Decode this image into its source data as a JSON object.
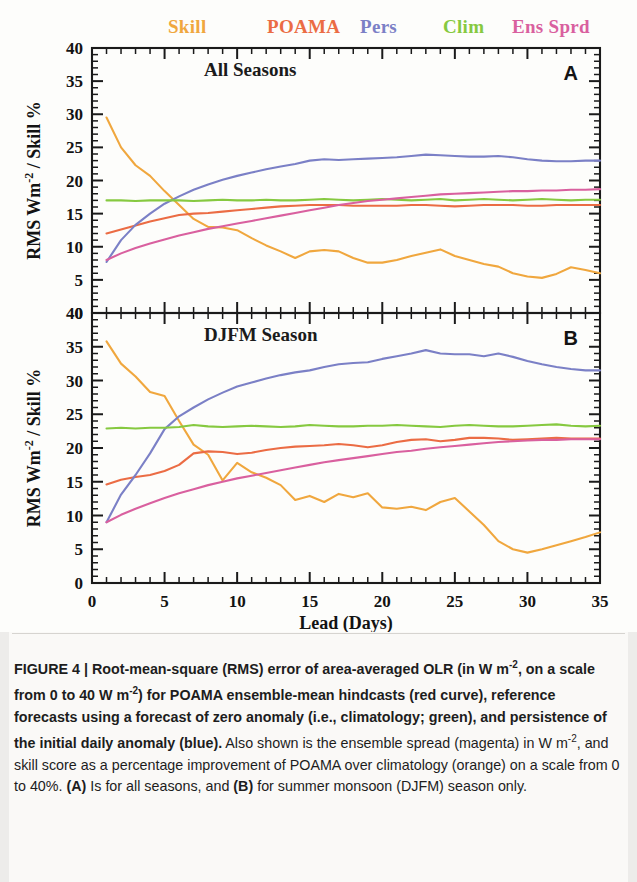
{
  "legend": [
    {
      "label": "Skill",
      "color": "#f0a73e",
      "x": 168
    },
    {
      "label": "POAMA",
      "color": "#eb6c44",
      "x": 267
    },
    {
      "label": "Pers",
      "color": "#7b80c6",
      "x": 360
    },
    {
      "label": "Clim",
      "color": "#86c940",
      "x": 443
    },
    {
      "label": "Ens Sprd",
      "color": "#d9609f",
      "x": 512
    }
  ],
  "axis": {
    "xlabel": "Lead (Days)",
    "ylabel_main": "RMS Wm",
    "ylabel_exp": "-2",
    "ylabel_tail": "/ Skill %",
    "xticks": [
      0,
      5,
      10,
      15,
      20,
      25,
      30,
      35
    ],
    "yticks": [
      0,
      5,
      10,
      15,
      20,
      25,
      30,
      35,
      40
    ],
    "xlim": [
      0,
      35
    ],
    "ylim": [
      0,
      40
    ]
  },
  "caption": {
    "figure_label": "FIGURE 4 |",
    "bold_lead": "Root-mean-square (RMS) error of area-averaged OLR (in W m",
    "bold_exp1": "-2",
    "bold_mid": ", on a scale from 0 to 40 W m",
    "bold_exp2": "-2",
    "bold_mid2": ") for POAMA ensemble-mean hindcasts (red curve), reference forecasts using a forecast of zero anomaly (i.e., climatology; green), and persistence of the initial daily anomaly (blue).",
    "normal_1": " Also shown is the ensemble spread (magenta) in W m",
    "exp3": "-2",
    "normal_2": ", and skill score as a percentage improvement of POAMA over climatology (orange) on a scale from 0 to 40%. ",
    "bold_A": "(A)",
    "normal_3": " Is for all seasons, and ",
    "bold_B": "(B)",
    "normal_4": " for summer monsoon (DJFM) season only."
  },
  "chart_data": [
    {
      "type": "line",
      "panel": "A",
      "title": "All Seasons",
      "letter": "A",
      "xlabel": "Lead (Days)",
      "ylabel": "RMS Wm-2 / Skill %",
      "xlim": [
        0,
        35
      ],
      "ylim": [
        0,
        40
      ],
      "grid": false,
      "x": [
        1,
        2,
        3,
        4,
        5,
        6,
        7,
        8,
        9,
        10,
        11,
        12,
        13,
        14,
        15,
        16,
        17,
        18,
        19,
        20,
        21,
        22,
        23,
        24,
        25,
        26,
        27,
        28,
        29,
        30,
        31,
        32,
        33,
        34,
        35
      ],
      "series": [
        {
          "name": "Skill",
          "color": "#f0a73e",
          "values": [
            29.5,
            25.0,
            22.3,
            20.7,
            18.4,
            16.3,
            14.2,
            13.0,
            12.9,
            12.5,
            11.3,
            10.2,
            9.3,
            8.3,
            9.3,
            9.5,
            9.3,
            8.3,
            7.6,
            7.6,
            8.0,
            8.6,
            9.1,
            9.6,
            8.6,
            8.0,
            7.4,
            7.0,
            6.0,
            5.5,
            5.3,
            5.9,
            6.9,
            6.5,
            6.0
          ]
        },
        {
          "name": "POAMA",
          "color": "#eb6c44",
          "values": [
            12.0,
            12.6,
            13.2,
            13.8,
            14.3,
            14.8,
            15.0,
            15.1,
            15.3,
            15.5,
            15.7,
            15.9,
            16.1,
            16.2,
            16.3,
            16.3,
            16.3,
            16.2,
            16.2,
            16.2,
            16.2,
            16.3,
            16.3,
            16.2,
            16.1,
            16.2,
            16.3,
            16.3,
            16.3,
            16.2,
            16.2,
            16.3,
            16.3,
            16.3,
            16.3
          ]
        },
        {
          "name": "Pers",
          "color": "#7b80c6",
          "values": [
            7.7,
            11.0,
            13.3,
            15.0,
            16.5,
            17.6,
            18.6,
            19.4,
            20.1,
            20.7,
            21.2,
            21.7,
            22.1,
            22.5,
            23.0,
            23.2,
            23.1,
            23.2,
            23.3,
            23.4,
            23.5,
            23.7,
            23.9,
            23.8,
            23.7,
            23.6,
            23.6,
            23.7,
            23.5,
            23.2,
            23.0,
            22.9,
            22.9,
            23.0,
            23.0
          ]
        },
        {
          "name": "Clim",
          "color": "#86c940",
          "values": [
            17.0,
            17.0,
            16.9,
            17.0,
            17.0,
            17.0,
            16.9,
            17.0,
            17.1,
            17.0,
            17.0,
            17.1,
            17.0,
            17.0,
            17.1,
            17.2,
            17.1,
            17.0,
            17.1,
            17.2,
            17.1,
            17.0,
            17.1,
            17.2,
            17.0,
            17.1,
            17.2,
            17.1,
            17.0,
            17.1,
            17.2,
            17.1,
            17.0,
            17.1,
            17.1
          ]
        },
        {
          "name": "Ens Sprd",
          "color": "#d9609f",
          "values": [
            8.0,
            9.0,
            9.8,
            10.5,
            11.1,
            11.7,
            12.2,
            12.7,
            13.1,
            13.5,
            13.9,
            14.3,
            14.7,
            15.1,
            15.5,
            15.9,
            16.3,
            16.6,
            16.9,
            17.1,
            17.3,
            17.5,
            17.7,
            17.9,
            18.0,
            18.1,
            18.2,
            18.3,
            18.4,
            18.4,
            18.5,
            18.5,
            18.6,
            18.6,
            18.7
          ]
        }
      ]
    },
    {
      "type": "line",
      "panel": "B",
      "title": "DJFM Season",
      "letter": "B",
      "xlabel": "Lead (Days)",
      "ylabel": "RMS Wm-2 / Skill %",
      "xlim": [
        0,
        35
      ],
      "ylim": [
        0,
        40
      ],
      "grid": false,
      "x": [
        1,
        2,
        3,
        4,
        5,
        6,
        7,
        8,
        9,
        10,
        11,
        12,
        13,
        14,
        15,
        16,
        17,
        18,
        19,
        20,
        21,
        22,
        23,
        24,
        25,
        26,
        27,
        28,
        29,
        30,
        31,
        32,
        33,
        34,
        35
      ],
      "series": [
        {
          "name": "Skill",
          "color": "#f0a73e",
          "values": [
            35.8,
            32.5,
            30.6,
            28.3,
            27.7,
            24.0,
            20.5,
            19.0,
            15.2,
            17.8,
            16.4,
            15.6,
            14.5,
            12.3,
            12.9,
            12.0,
            13.2,
            12.7,
            13.3,
            11.2,
            11.0,
            11.3,
            10.8,
            12.0,
            12.6,
            10.6,
            8.6,
            6.2,
            5.0,
            4.5,
            5.0,
            5.6,
            6.2,
            6.8,
            7.5
          ]
        },
        {
          "name": "POAMA",
          "color": "#eb6c44",
          "values": [
            14.6,
            15.3,
            15.7,
            16.0,
            16.6,
            17.5,
            19.2,
            19.5,
            19.4,
            19.1,
            19.3,
            19.7,
            20.0,
            20.2,
            20.3,
            20.4,
            20.6,
            20.4,
            20.1,
            20.4,
            20.9,
            21.2,
            21.3,
            21.0,
            21.2,
            21.5,
            21.5,
            21.4,
            21.2,
            21.3,
            21.4,
            21.5,
            21.4,
            21.4,
            21.4
          ]
        },
        {
          "name": "Pers",
          "color": "#7b80c6",
          "values": [
            9.0,
            13.1,
            16.0,
            19.2,
            22.8,
            24.7,
            26.0,
            27.2,
            28.2,
            29.1,
            29.7,
            30.3,
            30.8,
            31.2,
            31.5,
            32.0,
            32.4,
            32.6,
            32.7,
            33.2,
            33.6,
            34.0,
            34.5,
            34.0,
            33.9,
            33.9,
            33.6,
            34.0,
            33.5,
            32.9,
            32.4,
            32.0,
            31.7,
            31.5,
            31.5
          ]
        },
        {
          "name": "Clim",
          "color": "#86c940",
          "values": [
            22.9,
            23.0,
            22.9,
            23.0,
            23.0,
            23.1,
            23.4,
            23.2,
            23.1,
            23.2,
            23.3,
            23.2,
            23.1,
            23.2,
            23.4,
            23.3,
            23.2,
            23.2,
            23.3,
            23.3,
            23.4,
            23.3,
            23.2,
            23.1,
            23.3,
            23.4,
            23.3,
            23.2,
            23.2,
            23.3,
            23.4,
            23.5,
            23.3,
            23.2,
            23.3
          ]
        },
        {
          "name": "Ens Sprd",
          "color": "#d9609f",
          "values": [
            9.0,
            10.1,
            11.0,
            11.8,
            12.6,
            13.3,
            13.9,
            14.5,
            15.0,
            15.5,
            15.9,
            16.3,
            16.7,
            17.1,
            17.5,
            17.9,
            18.2,
            18.5,
            18.8,
            19.1,
            19.4,
            19.6,
            19.9,
            20.1,
            20.3,
            20.5,
            20.7,
            20.9,
            21.0,
            21.1,
            21.2,
            21.2,
            21.3,
            21.3,
            21.3
          ]
        }
      ]
    }
  ]
}
